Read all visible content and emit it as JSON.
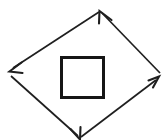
{
  "figure": {
    "kind": "line-diagram",
    "title": "",
    "width": 165,
    "height": 140,
    "background_color": "#ffffff",
    "stroke_color": "#1a1a1a"
  },
  "shapes": {
    "inner_square": {
      "name": "inner square",
      "x": 60,
      "y": 56,
      "width": 45,
      "height": 43,
      "stroke_color": "#161616",
      "stroke_width": 3
    },
    "diamond": {
      "name": "rotated square of arrows",
      "vertices": {
        "top": {
          "x": 100,
          "y": 11
        },
        "left": {
          "x": 10,
          "y": 70
        },
        "right": {
          "x": 159,
          "y": 78
        },
        "bottom": {
          "x": 80,
          "y": 139
        }
      },
      "stroke_color": "#1f1f1f",
      "stroke_width": 1.7,
      "direction": "counter-clockwise"
    }
  },
  "arrows": [
    {
      "id": "arrow-top-left",
      "label": "top-left edge",
      "from": "top",
      "to": "left",
      "points_toward": "southwest",
      "x1": 100,
      "y1": 11,
      "x2": 10,
      "y2": 70,
      "head_at": "end"
    },
    {
      "id": "arrow-bottom-left",
      "label": "bottom-left edge",
      "from": "left",
      "to": "bottom",
      "points_toward": "southeast",
      "x1": 10,
      "y1": 74,
      "x2": 80,
      "y2": 139,
      "head_at": "end"
    },
    {
      "id": "arrow-bottom-right",
      "label": "bottom-right edge",
      "from": "bottom",
      "to": "right",
      "points_toward": "northeast",
      "x1": 80,
      "y1": 139,
      "x2": 159,
      "y2": 78,
      "head_at": "end"
    },
    {
      "id": "arrow-top-right",
      "label": "top-right edge",
      "from": "right",
      "to": "top",
      "points_toward": "northwest",
      "x1": 162,
      "y1": 74,
      "x2": 100,
      "y2": 11,
      "head_at": "end"
    }
  ],
  "geometry": {
    "square_path": "M 61.5 57.5 L 103.5 57.5 L 103.5 97.5 L 61.5 97.5 Z",
    "line_top_left": "M 99 12 L 13 68",
    "line_bottom_left": "M 11 76 L 78 136",
    "line_bottom_right": "M 81 137 L 156 80",
    "line_top_right": "M 160 73 L 102 13",
    "head_top_left": "M 21.5 62.5 L 9.5 71.5 L 22.5 73.0",
    "head_bottom_left": "M 70.5 129.0 L 80.0 139.5 L 80.5 127.0",
    "head_bottom_right": "M 148.5 80.5 L 159.0 76.5 L 153.0 87.5",
    "head_top_right": "M 99.0 23.5 L 99.5 11.0 L 111.5 20.0"
  }
}
